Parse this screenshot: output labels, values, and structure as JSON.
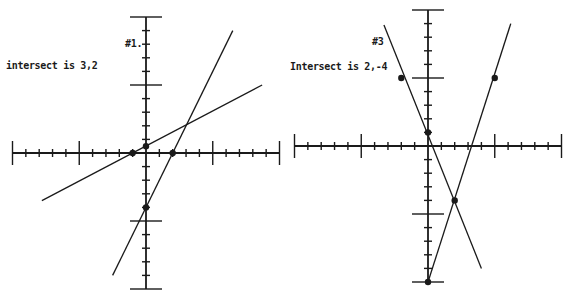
{
  "page": {
    "background": "#ffffff",
    "ink_color": "#1a1a1a"
  },
  "chart_data": [
    {
      "type": "line",
      "title": "#1.",
      "annotation": "intersect is 3,2",
      "xlabel": "",
      "ylabel": "",
      "xlim": [
        -10,
        10
      ],
      "ylim": [
        -10,
        10
      ],
      "major_ticks": [
        -10,
        -5,
        0,
        5,
        10
      ],
      "minor_tick_step": 1,
      "grid": false,
      "legend": null,
      "series": [
        {
          "name": "steep line",
          "equation": "y = 2x - 4",
          "x": [
            -2.5,
            0,
            2,
            3,
            6.5
          ],
          "y": [
            -9,
            -4,
            0,
            2,
            9
          ],
          "marked_points": [
            [
              0,
              -4
            ],
            [
              2,
              0
            ]
          ]
        },
        {
          "name": "shallow line",
          "equation": "y = 0.5x + 0.5",
          "x": [
            -7.8,
            -1,
            0,
            3,
            8.7
          ],
          "y": [
            -3.5,
            0,
            0.5,
            2,
            5
          ]
        }
      ],
      "intersection": [
        3,
        2
      ],
      "marked_points": [
        [
          -1,
          0
        ],
        [
          0,
          0.5
        ],
        [
          2,
          0
        ],
        [
          0,
          -4
        ]
      ],
      "pixel_frame": {
        "origin": [
          146,
          153
        ],
        "px_per_unit_x": 13.35,
        "px_per_unit_y": 13.6,
        "x_axis": [
          12,
          279
        ],
        "y_axis": [
          17,
          289
        ]
      }
    },
    {
      "type": "line",
      "title": "#3",
      "annotation": "Intersect is 2,-4",
      "xlabel": "",
      "ylabel": "",
      "xlim": [
        -10,
        10
      ],
      "ylim": [
        -10,
        10
      ],
      "major_ticks": [
        -10,
        -5,
        0,
        5,
        10
      ],
      "minor_tick_step": 1,
      "grid": false,
      "legend": null,
      "series": [
        {
          "name": "falling line",
          "equation": "y = -2.5x + 1",
          "x": [
            -3.3,
            -2,
            0,
            2,
            4
          ],
          "y": [
            8.9,
            5,
            1,
            -4,
            -9
          ]
        },
        {
          "name": "rising line",
          "equation": "y = 3x - 10",
          "x": [
            0,
            2,
            5,
            6.2
          ],
          "y": [
            -10,
            -4,
            5,
            9
          ]
        }
      ],
      "intersection": [
        2,
        -4
      ],
      "marked_points": [
        [
          -2,
          5
        ],
        [
          0,
          1
        ],
        [
          5,
          5
        ],
        [
          2,
          -4
        ],
        [
          0,
          -10
        ]
      ],
      "pixel_frame": {
        "origin": [
          428,
          146
        ],
        "px_per_unit_x": 13.35,
        "px_per_unit_y": 13.6,
        "x_axis": [
          294,
          560
        ],
        "y_axis": [
          10,
          282
        ]
      }
    }
  ],
  "graphs": {
    "g1": {
      "title": "#1.",
      "note": "intersect is 3,2"
    },
    "g3": {
      "title": "#3",
      "note": "Intersect is 2,-4"
    }
  }
}
